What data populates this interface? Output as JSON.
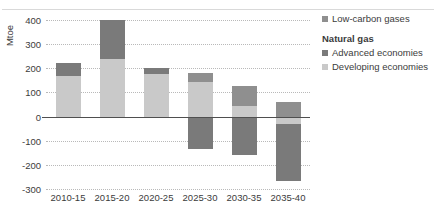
{
  "axis": {
    "ylabel": "Mtoe",
    "yticks": [
      400,
      300,
      200,
      100,
      0,
      -100,
      -200,
      -300
    ]
  },
  "legend": {
    "low_carbon_label": "Low-carbon gases",
    "group_heading": "Natural gas",
    "advanced_label": "Advanced economies",
    "developing_label": "Developing economies"
  },
  "colors": {
    "low_carbon": "#8f8f8f",
    "advanced": "#7a7a7a",
    "developing": "#c9c9c9",
    "gridline": "#b9b9b9",
    "zeroline": "#4f4f4f",
    "text": "#3b3b3b"
  },
  "chart_data": {
    "type": "bar",
    "stacked": true,
    "title": "",
    "xlabel": "",
    "ylabel": "Mtoe",
    "ylim": [
      -300,
      400
    ],
    "ytick_step": 100,
    "grid": true,
    "legend_position": "right",
    "categories": [
      "2010-15",
      "2015-20",
      "2020-25",
      "2025-30",
      "2030-35",
      "2035-40"
    ],
    "series": [
      {
        "name": "Developing economies",
        "color": "#c9c9c9",
        "values": [
          170,
          240,
          175,
          145,
          45,
          -30
        ]
      },
      {
        "name": "Advanced economies",
        "color": "#7a7a7a",
        "values": [
          50,
          160,
          25,
          -135,
          -160,
          -235
        ]
      },
      {
        "name": "Low-carbon gases",
        "color": "#8f8f8f",
        "values": [
          0,
          0,
          0,
          35,
          80,
          60
        ]
      }
    ],
    "bar_tops": [
      220,
      400,
      200,
      180,
      125,
      60
    ],
    "bar_bottoms": [
      0,
      0,
      0,
      -135,
      -160,
      -265
    ]
  }
}
